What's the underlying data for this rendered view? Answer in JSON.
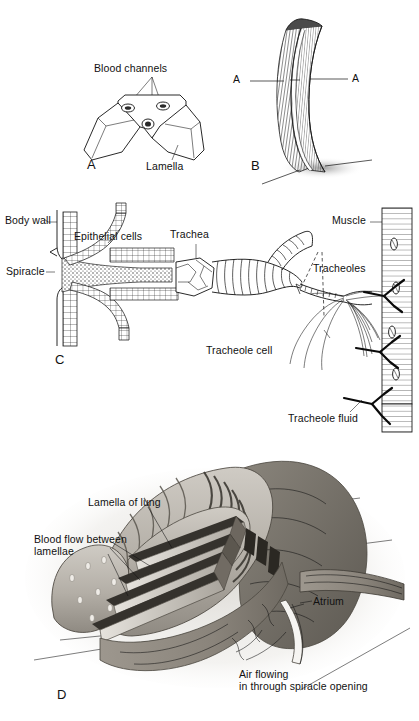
{
  "figure": {
    "background_color": "#ffffff",
    "ink_color": "#111111",
    "panels": [
      {
        "id": "A",
        "letter": "A",
        "caption": "Cross-section through paired gill lamellae showing blood channels",
        "labels": [
          {
            "name": "blood-channels",
            "text": "Blood channels"
          },
          {
            "name": "lamella",
            "text": "Lamella"
          }
        ]
      },
      {
        "id": "B",
        "letter": "B",
        "caption": "Whole curved gill lamella with plane of section",
        "labels": [
          {
            "name": "section-marker-left",
            "text": "A"
          },
          {
            "name": "section-marker-right",
            "text": "A"
          }
        ]
      },
      {
        "id": "C",
        "letter": "C",
        "caption": "Insect tracheal system from spiracle to tracheoles on muscle",
        "labels": [
          {
            "name": "body-wall",
            "text": "Body wall"
          },
          {
            "name": "epithelial-cells",
            "text": "Epithelial cells"
          },
          {
            "name": "spiracle",
            "text": "Spiracle"
          },
          {
            "name": "trachea",
            "text": "Trachea"
          },
          {
            "name": "tracheoles",
            "text": "Tracheoles"
          },
          {
            "name": "tracheole-cell",
            "text": "Tracheole cell"
          },
          {
            "name": "tracheole-fluid",
            "text": "Tracheole fluid"
          },
          {
            "name": "muscle",
            "text": "Muscle"
          }
        ]
      },
      {
        "id": "D",
        "letter": "D",
        "caption": "Cutaway of an arachnid book lung",
        "labels": [
          {
            "name": "lamella-of-lung",
            "text": "Lamella of lung"
          },
          {
            "name": "blood-flow-between-lamellae",
            "text": "Blood flow between\nlamellae"
          },
          {
            "name": "atrium",
            "text": "Atrium"
          },
          {
            "name": "air-flowing-spiracle",
            "text": "Air flowing\nin through spiracle opening"
          }
        ]
      }
    ]
  }
}
